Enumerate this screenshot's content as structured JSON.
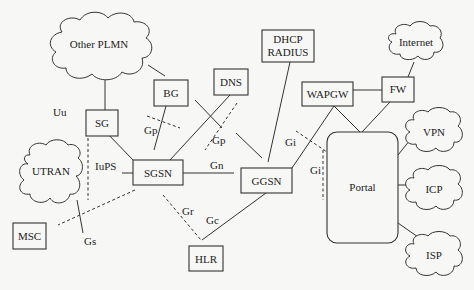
{
  "diagram": {
    "title": "",
    "nodes": {
      "other_plmn": "Other PLMN",
      "bg": "BG",
      "dns": "DNS",
      "dhcp": "DHCP",
      "radius": "RADIUS",
      "internet": "Internet",
      "wapgw": "WAPGW",
      "fw": "FW",
      "sg": "SG",
      "sgsn": "SGSN",
      "ggsn": "GGSN",
      "portal": "Portal",
      "vpn": "VPN",
      "icp": "ICP",
      "isp": "ISP",
      "utran": "UTRAN",
      "msc": "MSC",
      "hlr": "HLR"
    },
    "interfaces": {
      "uu": "Uu",
      "gp1": "Gp",
      "gp2": "Gp",
      "iups": "IuPS",
      "gn": "Gn",
      "gi1": "Gi",
      "gi2": "Gi",
      "gr": "Gr",
      "gc": "Gc",
      "gs": "Gs"
    },
    "edges": [
      {
        "from": "Other PLMN",
        "to": "SG",
        "style": "solid"
      },
      {
        "from": "Other PLMN",
        "to": "BG",
        "style": "solid"
      },
      {
        "from": "SG",
        "to": "SGSN",
        "style": "solid"
      },
      {
        "from": "BG",
        "to": "SGSN",
        "style": "solid",
        "interface": "Gp"
      },
      {
        "from": "DNS",
        "to": "SGSN",
        "style": "solid"
      },
      {
        "from": "DNS",
        "to": "GGSN",
        "style": "solid",
        "interface": "Gp"
      },
      {
        "from": "SGSN",
        "to": "GGSN",
        "style": "solid",
        "interface": "Gn"
      },
      {
        "from": "DHCP/RADIUS",
        "to": "GGSN",
        "style": "solid"
      },
      {
        "from": "GGSN",
        "to": "WAPGW",
        "style": "solid",
        "interface": "Gi"
      },
      {
        "from": "WAPGW",
        "to": "FW",
        "style": "solid"
      },
      {
        "from": "WAPGW",
        "to": "Portal",
        "style": "solid"
      },
      {
        "from": "FW",
        "to": "Portal",
        "style": "solid"
      },
      {
        "from": "FW",
        "to": "Internet",
        "style": "solid"
      },
      {
        "from": "Portal",
        "to": "VPN",
        "style": "solid"
      },
      {
        "from": "Portal",
        "to": "ICP",
        "style": "solid"
      },
      {
        "from": "Portal",
        "to": "ISP",
        "style": "solid"
      },
      {
        "from": "SGSN",
        "to": "UTRAN",
        "style": "solid",
        "interface": "IuPS"
      },
      {
        "from": "SGSN",
        "to": "MSC",
        "style": "dashed",
        "interface": "Gs"
      },
      {
        "from": "SGSN",
        "to": "HLR",
        "style": "dashed",
        "interface": "Gr"
      },
      {
        "from": "GGSN",
        "to": "HLR",
        "style": "solid",
        "interface": "Gc"
      }
    ]
  }
}
